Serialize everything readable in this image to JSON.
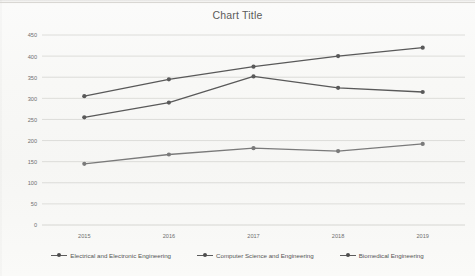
{
  "chart_data": {
    "type": "line",
    "title": "Chart Title",
    "xlabel": "",
    "ylabel": "",
    "categories": [
      "2015",
      "2016",
      "2017",
      "2018",
      "2019"
    ],
    "ylim": [
      0,
      450
    ],
    "yticks": [
      0,
      50,
      100,
      150,
      200,
      250,
      300,
      350,
      400,
      450
    ],
    "grid": true,
    "legend_position": "bottom",
    "series": [
      {
        "name": "Electrical and Electronic Engineering",
        "values": [
          305,
          345,
          375,
          400,
          420
        ],
        "color": "#595959",
        "marker": "circle"
      },
      {
        "name": "Computer Science and Engineering",
        "values": [
          255,
          290,
          352,
          325,
          315
        ],
        "color": "#595959",
        "marker": "circle"
      },
      {
        "name": "Biomedical Engineering",
        "values": [
          145,
          167,
          182,
          175,
          192
        ],
        "color": "#7a7a7a",
        "marker": "circle"
      }
    ]
  },
  "chart": {
    "title": "Chart Title",
    "ytick_labels": [
      "450",
      "400",
      "350",
      "300",
      "250",
      "200",
      "150",
      "100",
      "50",
      "0"
    ],
    "xtick_labels": [
      "2015",
      "2016",
      "2017",
      "2018",
      "2019"
    ],
    "legend": [
      {
        "label": "Electrical and Electronic Engineering"
      },
      {
        "label": "Computer Science and Engineering"
      },
      {
        "label": "Biomedical Engineering"
      }
    ]
  }
}
